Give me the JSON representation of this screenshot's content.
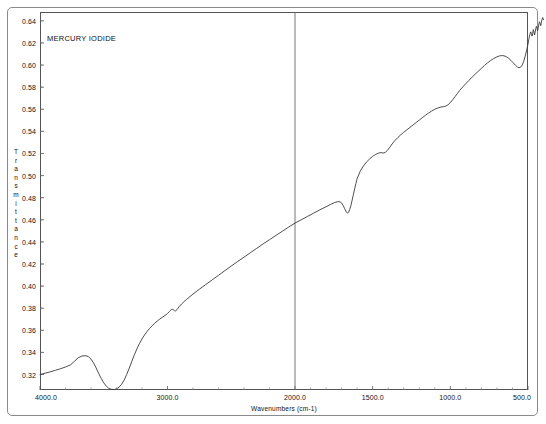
{
  "chart_data": {
    "type": "line",
    "title": "MERCURY IODIDE",
    "xlabel": "Wavenumbers (cm-1)",
    "ylabel": "Transmittance",
    "ylabel_chars": [
      "T",
      "r",
      "a",
      "n",
      "s",
      "m",
      "i",
      "t",
      "t",
      "a",
      "n",
      "c",
      "e"
    ],
    "xlim": [
      4000.0,
      400.0
    ],
    "ylim": [
      0.306,
      0.648
    ],
    "x_reversed": true,
    "axis_break": 2000.0,
    "grid": false,
    "legend": null,
    "x_ticks_major": [
      4000.0,
      3000.0,
      2000.0,
      1500.0,
      1000.0,
      500.0
    ],
    "x_tick_labels": [
      "4000.0",
      "3000.0",
      "2000.0",
      "1500.0",
      "1000.0",
      "500.0"
    ],
    "x_ticks_minor_left": [
      3800,
      3600,
      3400,
      3200,
      2800,
      2600,
      2400,
      2200
    ],
    "x_ticks_minor_right": [
      1900,
      1800,
      1700,
      1600,
      1400,
      1300,
      1200,
      1100,
      900,
      800,
      700,
      600
    ],
    "y_ticks": [
      0.32,
      0.34,
      0.36,
      0.38,
      0.4,
      0.42,
      0.44,
      0.46,
      0.48,
      0.5,
      0.52,
      0.54,
      0.56,
      0.58,
      0.6,
      0.62,
      0.64
    ],
    "y_tick_labels": [
      "0.32",
      "0.34",
      "0.36",
      "0.38",
      "0.40",
      "0.42",
      "0.44",
      "0.46",
      "0.48",
      "0.50",
      "0.52",
      "0.54",
      "0.56",
      "0.58",
      "0.60",
      "0.62",
      "0.64"
    ],
    "series": [
      {
        "name": "Mercury iodide IR transmittance",
        "color": "#3a3a3a",
        "points": [
          [
            4000,
            0.32
          ],
          [
            3960,
            0.3212
          ],
          [
            3920,
            0.3224
          ],
          [
            3880,
            0.3238
          ],
          [
            3840,
            0.3252
          ],
          [
            3800,
            0.3268
          ],
          [
            3760,
            0.3288
          ],
          [
            3730,
            0.332
          ],
          [
            3700,
            0.3352
          ],
          [
            3670,
            0.3368
          ],
          [
            3640,
            0.337
          ],
          [
            3620,
            0.3362
          ],
          [
            3600,
            0.334
          ],
          [
            3580,
            0.3305
          ],
          [
            3560,
            0.326
          ],
          [
            3540,
            0.321
          ],
          [
            3520,
            0.3165
          ],
          [
            3500,
            0.3125
          ],
          [
            3480,
            0.3095
          ],
          [
            3460,
            0.3075
          ],
          [
            3440,
            0.3066
          ],
          [
            3420,
            0.3064
          ],
          [
            3400,
            0.307
          ],
          [
            3380,
            0.3086
          ],
          [
            3360,
            0.3112
          ],
          [
            3340,
            0.315
          ],
          [
            3320,
            0.32
          ],
          [
            3300,
            0.3258
          ],
          [
            3280,
            0.3318
          ],
          [
            3260,
            0.3378
          ],
          [
            3240,
            0.3432
          ],
          [
            3220,
            0.348
          ],
          [
            3200,
            0.3522
          ],
          [
            3180,
            0.3558
          ],
          [
            3160,
            0.359
          ],
          [
            3140,
            0.3618
          ],
          [
            3120,
            0.3642
          ],
          [
            3100,
            0.3664
          ],
          [
            3080,
            0.3684
          ],
          [
            3060,
            0.3702
          ],
          [
            3040,
            0.3718
          ],
          [
            3020,
            0.3734
          ],
          [
            3000,
            0.3752
          ],
          [
            2985,
            0.377
          ],
          [
            2970,
            0.3788
          ],
          [
            2958,
            0.379
          ],
          [
            2946,
            0.3778
          ],
          [
            2936,
            0.3776
          ],
          [
            2925,
            0.3788
          ],
          [
            2910,
            0.3812
          ],
          [
            2890,
            0.3838
          ],
          [
            2870,
            0.386
          ],
          [
            2850,
            0.388
          ],
          [
            2800,
            0.3928
          ],
          [
            2750,
            0.3972
          ],
          [
            2700,
            0.4014
          ],
          [
            2650,
            0.4056
          ],
          [
            2600,
            0.4098
          ],
          [
            2550,
            0.414
          ],
          [
            2500,
            0.4182
          ],
          [
            2450,
            0.4222
          ],
          [
            2400,
            0.4262
          ],
          [
            2350,
            0.4302
          ],
          [
            2300,
            0.4342
          ],
          [
            2250,
            0.4382
          ],
          [
            2200,
            0.442
          ],
          [
            2150,
            0.4458
          ],
          [
            2100,
            0.4496
          ],
          [
            2050,
            0.4534
          ],
          [
            2000,
            0.457
          ],
          [
            1960,
            0.46
          ],
          [
            1920,
            0.463
          ],
          [
            1880,
            0.466
          ],
          [
            1840,
            0.469
          ],
          [
            1800,
            0.4718
          ],
          [
            1770,
            0.474
          ],
          [
            1745,
            0.4756
          ],
          [
            1725,
            0.4764
          ],
          [
            1710,
            0.4762
          ],
          [
            1700,
            0.4752
          ],
          [
            1690,
            0.473
          ],
          [
            1680,
            0.47
          ],
          [
            1670,
            0.4672
          ],
          [
            1662,
            0.466
          ],
          [
            1655,
            0.4668
          ],
          [
            1648,
            0.4692
          ],
          [
            1640,
            0.473
          ],
          [
            1632,
            0.4778
          ],
          [
            1624,
            0.483
          ],
          [
            1616,
            0.488
          ],
          [
            1608,
            0.4928
          ],
          [
            1600,
            0.4972
          ],
          [
            1580,
            0.504
          ],
          [
            1560,
            0.5086
          ],
          [
            1540,
            0.5122
          ],
          [
            1520,
            0.515
          ],
          [
            1500,
            0.5174
          ],
          [
            1480,
            0.5192
          ],
          [
            1460,
            0.5204
          ],
          [
            1445,
            0.5208
          ],
          [
            1432,
            0.5204
          ],
          [
            1420,
            0.5208
          ],
          [
            1405,
            0.5228
          ],
          [
            1390,
            0.5256
          ],
          [
            1375,
            0.5286
          ],
          [
            1360,
            0.5312
          ],
          [
            1340,
            0.5342
          ],
          [
            1320,
            0.5368
          ],
          [
            1300,
            0.5392
          ],
          [
            1280,
            0.5414
          ],
          [
            1260,
            0.5436
          ],
          [
            1240,
            0.5458
          ],
          [
            1220,
            0.548
          ],
          [
            1200,
            0.5502
          ],
          [
            1180,
            0.5524
          ],
          [
            1160,
            0.5546
          ],
          [
            1140,
            0.5566
          ],
          [
            1120,
            0.5584
          ],
          [
            1100,
            0.56
          ],
          [
            1080,
            0.5612
          ],
          [
            1060,
            0.562
          ],
          [
            1045,
            0.5624
          ],
          [
            1030,
            0.5628
          ],
          [
            1015,
            0.564
          ],
          [
            1000,
            0.566
          ],
          [
            985,
            0.5686
          ],
          [
            970,
            0.5714
          ],
          [
            955,
            0.5742
          ],
          [
            940,
            0.577
          ],
          [
            920,
            0.5802
          ],
          [
            900,
            0.5832
          ],
          [
            880,
            0.5862
          ],
          [
            860,
            0.589
          ],
          [
            840,
            0.5918
          ],
          [
            820,
            0.5944
          ],
          [
            800,
            0.597
          ],
          [
            780,
            0.5996
          ],
          [
            760,
            0.602
          ],
          [
            740,
            0.6042
          ],
          [
            720,
            0.606
          ],
          [
            700,
            0.6074
          ],
          [
            685,
            0.6082
          ],
          [
            670,
            0.6086
          ],
          [
            655,
            0.6084
          ],
          [
            640,
            0.6076
          ],
          [
            625,
            0.6062
          ],
          [
            610,
            0.6042
          ],
          [
            595,
            0.602
          ],
          [
            580,
            0.5998
          ],
          [
            568,
            0.5982
          ],
          [
            558,
            0.5976
          ],
          [
            548,
            0.598
          ],
          [
            538,
            0.5998
          ],
          [
            528,
            0.6032
          ],
          [
            518,
            0.608
          ],
          [
            508,
            0.6138
          ],
          [
            500,
            0.619
          ],
          [
            494,
            0.6238
          ],
          [
            488,
            0.6276
          ],
          [
            483,
            0.63
          ],
          [
            478,
            0.6286
          ],
          [
            474,
            0.6262
          ],
          [
            470,
            0.6284
          ],
          [
            466,
            0.632
          ],
          [
            462,
            0.63
          ],
          [
            458,
            0.6272
          ],
          [
            454,
            0.6296
          ],
          [
            450,
            0.633
          ],
          [
            446,
            0.635
          ],
          [
            442,
            0.6332
          ],
          [
            438,
            0.631
          ],
          [
            434,
            0.6338
          ],
          [
            430,
            0.6372
          ],
          [
            426,
            0.6392
          ],
          [
            422,
            0.6376
          ],
          [
            418,
            0.6356
          ],
          [
            414,
            0.6384
          ],
          [
            410,
            0.6412
          ],
          [
            406,
            0.643
          ],
          [
            402,
            0.6418
          ],
          [
            400,
            0.641
          ]
        ]
      }
    ]
  }
}
